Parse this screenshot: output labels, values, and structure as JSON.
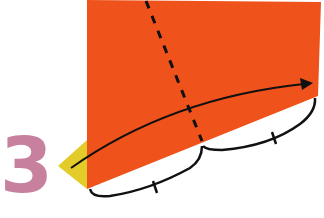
{
  "diagram": {
    "type": "origami-instruction-step",
    "step_number": "3",
    "colors": {
      "paper_front": "#f0521c",
      "paper_back": "#e3cb2a",
      "step_number": "#c7819f",
      "lines": "#111111",
      "background": "#ffffff"
    },
    "elements": [
      {
        "kind": "paper-shape",
        "description": "Orange quadrilateral paper, front side"
      },
      {
        "kind": "paper-flap",
        "description": "Yellow triangular flap on left edge, back side of paper"
      },
      {
        "kind": "valley-fold-line",
        "description": "Dashed fold line, slightly slanted, dividing bottom edge into two equal parts"
      },
      {
        "kind": "fold-arrow",
        "description": "Curved arrow from left flap tip to right corner, indicating fold direction"
      },
      {
        "kind": "measure-bracket",
        "description": "Left bracket spanning bottom edge segment, marked with equal tick"
      },
      {
        "kind": "measure-bracket",
        "description": "Right bracket spanning bottom edge segment, marked with equal tick"
      }
    ]
  }
}
